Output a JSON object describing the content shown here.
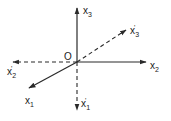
{
  "diagram": {
    "origin": {
      "label": "O",
      "x": 77,
      "y": 62
    },
    "colors": {
      "line": "#2a2a2a",
      "background": "#ffffff"
    },
    "axes": [
      {
        "id": "x3",
        "base": "x",
        "sub": "3",
        "prime": "",
        "style": "solid",
        "end": [
          77,
          7
        ]
      },
      {
        "id": "x2",
        "base": "x",
        "sub": "2",
        "prime": "",
        "style": "solid",
        "end": [
          147,
          62
        ]
      },
      {
        "id": "x1",
        "base": "x",
        "sub": "1",
        "prime": "",
        "style": "solid",
        "end": [
          28,
          89
        ]
      },
      {
        "id": "x3p",
        "base": "x",
        "sub": "3",
        "prime": "'",
        "style": "dashed",
        "end": [
          127,
          29
        ]
      },
      {
        "id": "x2p",
        "base": "x",
        "sub": "2",
        "prime": "'",
        "style": "dashed",
        "end": [
          12,
          62
        ]
      },
      {
        "id": "x1p",
        "base": "x",
        "sub": "1",
        "prime": "'",
        "style": "dashed",
        "end": [
          77,
          111
        ]
      }
    ],
    "labels": {
      "x3": {
        "base": "x",
        "sub": "3",
        "prime": ""
      },
      "x2": {
        "base": "x",
        "sub": "2",
        "prime": ""
      },
      "x1": {
        "base": "x",
        "sub": "1",
        "prime": ""
      },
      "x3p": {
        "base": "x",
        "sub": "3",
        "prime": "'"
      },
      "x2p": {
        "base": "x",
        "sub": "2",
        "prime": "'"
      },
      "x1p": {
        "base": "x",
        "sub": "1",
        "prime": "'"
      }
    }
  }
}
